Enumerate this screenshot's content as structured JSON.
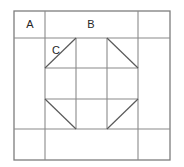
{
  "figure": {
    "kind": "quilt-block-piecing-diagram",
    "background_color": "#ffffff",
    "line_color": "#8a8a8a",
    "diagonal_color": "#5a5a5a",
    "border_color": "#7d7d7d",
    "label_color": "#262626"
  },
  "labels": {
    "a": "A",
    "b": "B",
    "c": "C"
  },
  "geometry": {
    "outer": {
      "x1": 14,
      "y1": 11,
      "x2": 170,
      "y2": 160
    },
    "vertical_lines": [
      45,
      76,
      107,
      138
    ],
    "horizontal_lines": [
      38,
      68,
      99,
      129
    ],
    "inner_grid": {
      "x1": 45,
      "y1": 38,
      "x2": 138,
      "y2": 129
    }
  },
  "label_positions": {
    "a": {
      "x": 30,
      "y": 24
    },
    "b": {
      "x": 91,
      "y": 24
    },
    "c": {
      "x": 55,
      "y": 50
    }
  }
}
